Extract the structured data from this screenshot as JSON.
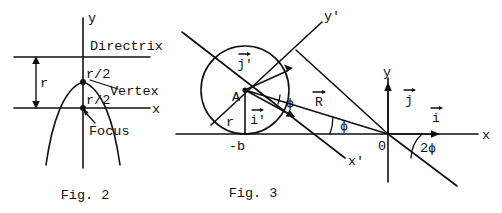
{
  "document": {
    "kind": "two-panel mathematical line figure",
    "background_color": "#ffffff",
    "ink_color": "#111111"
  },
  "figure2": {
    "caption": "Fig. 2",
    "axis_labels": {
      "y": "y",
      "x": "x"
    },
    "annotations": {
      "directrix": "Directrix",
      "vertex": "Vertex",
      "focus": "Focus",
      "radius": "r",
      "half_radius_upper": "r/2",
      "half_radius_lower": "r/2"
    },
    "description": "Downward-opening parabola with vertex on the y-axis midway between the horizontal directrix line above and the focus on the x-axis below; vertical double arrow labeled r spans directrix to x-axis."
  },
  "figure3": {
    "caption": "Fig. 3",
    "axis_labels": {
      "x": "x",
      "y": "y",
      "x_prime": "x'",
      "y_prime": "y'"
    },
    "points": {
      "origin": "0",
      "circle_center": "A",
      "x_intercept": "-b"
    },
    "vectors": {
      "i_hat": "i",
      "j_hat": "j",
      "i_prime": "i'",
      "j_prime": "j'",
      "R": "R"
    },
    "angles": {
      "phi_at_A": "ϕ",
      "phi_at_origin": "ϕ",
      "two_phi": "2ϕ"
    },
    "lengths": {
      "radius": "r"
    },
    "description": "Circle of radius r centered at A tangent to the x-axis at -b; rotated axes x' and y' through A; vector R from origin to a point on the circle; angle phi between R and x-axis and angle 2 phi below the x-axis at the origin."
  }
}
